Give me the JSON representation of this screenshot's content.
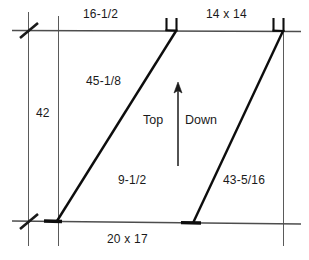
{
  "drawing": {
    "title": "Stair Stringer Layout Dimension Drawing",
    "background_color": "#ffffff",
    "line_color": "#4d4d4d",
    "heavy_line_color": "#000000",
    "text_color": "#1a1a1a",
    "width": 309,
    "height": 260
  },
  "labels": {
    "top_left_dimension": "16-1/2",
    "top_right_dimension": "14 x 14",
    "left_vertical_dimension": "42",
    "upper_diagonal_dimension": "45-1/8",
    "lower_left_dimension": "9-1/2",
    "lower_right_diagonal_dimension": "43-5/16",
    "bottom_dimension": "20 x 17"
  },
  "flow": {
    "left_text": "Top",
    "right_text": "Down",
    "arrow_direction": "up"
  },
  "geometry": {
    "top_rail": {
      "x1": 12,
      "y1": 30,
      "x2": 301,
      "y2": 31
    },
    "bottom_rail": {
      "x1": 12,
      "y1": 221,
      "x2": 301,
      "y2": 224
    },
    "left_tick_extension": {
      "x": 28,
      "y1": 12,
      "y2": 245
    },
    "inner_left_extension": {
      "x": 58,
      "y1": 16,
      "y2": 245
    },
    "right_extension": {
      "x": 283,
      "y1": 30,
      "y2": 245
    },
    "diagonal_upper": {
      "x1": 57,
      "y1": 221,
      "x2": 176,
      "y2": 31
    },
    "diagonal_lower": {
      "x1": 193,
      "y1": 223,
      "x2": 283,
      "y2": 31
    },
    "flow_arrow": {
      "x": 178,
      "y_top": 86,
      "y_bottom": 165
    },
    "notch_upper": {
      "x": 170,
      "y": 20
    },
    "notch_lower": {
      "x": 277,
      "y": 20
    }
  }
}
